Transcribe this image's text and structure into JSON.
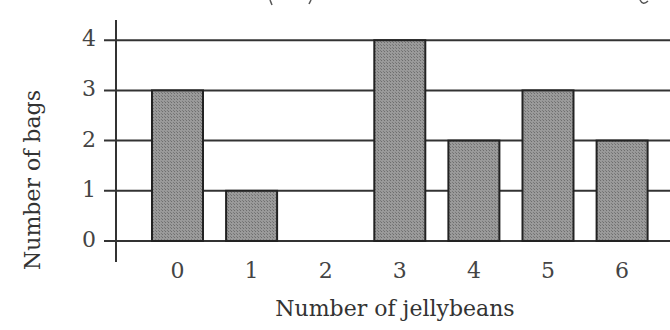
{
  "chart_data": {
    "type": "bar",
    "title": "",
    "xlabel": "Number of jellybeans",
    "ylabel": "Number of bags",
    "categories": [
      "0",
      "1",
      "2",
      "3",
      "4",
      "5",
      "6"
    ],
    "values": [
      3,
      1,
      0,
      4,
      2,
      3,
      2
    ],
    "y_ticks": [
      "0",
      "1",
      "2",
      "3",
      "4"
    ],
    "ylim": [
      0,
      4
    ],
    "grid": true,
    "legend": null,
    "bar_color": "#8c8c8c",
    "note": "Title at top is cropped; only descender fragments visible"
  }
}
